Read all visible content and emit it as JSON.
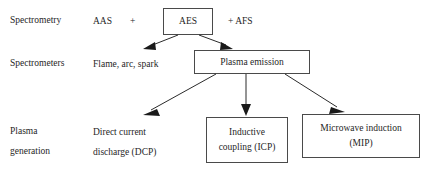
{
  "diagram": {
    "rows": [
      {
        "id": "row-spectrometry",
        "label": "Spectrometry"
      },
      {
        "id": "row-spectrometers",
        "label": "Spectrometers"
      },
      {
        "id": "row-plasma-generation",
        "label_line1": "Plasma",
        "label_line2": "generation"
      }
    ],
    "texts": {
      "aas": "AAS",
      "plus_left": "+",
      "plus_right": "+ AFS",
      "flame_arc_spark": "Flame, arc, spark",
      "dcp_line1": "Direct current",
      "dcp_line2": "discharge (DCP)"
    },
    "boxes": [
      {
        "id": "box-aes",
        "label": "AES"
      },
      {
        "id": "box-plasma-emission",
        "label": "Plasma emission"
      },
      {
        "id": "box-icp",
        "label_line1": "Inductive",
        "label_line2": "coupling (ICP)"
      },
      {
        "id": "box-mip",
        "label_line1": "Microwave induction",
        "label_line2": "(MIP)"
      }
    ],
    "edges": [
      {
        "id": "edge-aes-to-flame",
        "from": "box-aes",
        "to": "flame-arc-spark",
        "kind": "arrow"
      },
      {
        "id": "edge-aes-to-plasma-emission",
        "from": "box-aes",
        "to": "box-plasma-emission",
        "kind": "arrow"
      },
      {
        "id": "edge-plasma-to-dcp",
        "from": "box-plasma-emission",
        "to": "dcp-text",
        "kind": "arrow"
      },
      {
        "id": "edge-plasma-to-icp",
        "from": "box-plasma-emission",
        "to": "box-icp",
        "kind": "arrow"
      },
      {
        "id": "edge-plasma-to-mip",
        "from": "box-plasma-emission",
        "to": "box-mip",
        "kind": "arrow"
      }
    ],
    "colors": {
      "background": "#ffffff",
      "text": "#262626",
      "box_border": "#4a4a4a",
      "edge": "#2b2b2b"
    }
  }
}
